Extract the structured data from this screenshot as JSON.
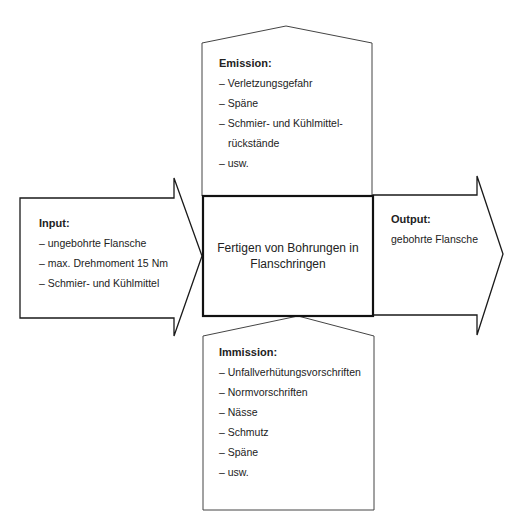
{
  "diagram": {
    "center": {
      "label": "Fertigen von Bohrungen in Flanschringen"
    },
    "emission": {
      "title": "Emission:",
      "items": [
        "– Verletzungsgefahr",
        "– Späne",
        "– Schmier- und Kühlmittel-",
        "  rückstände",
        "– usw."
      ]
    },
    "input": {
      "title": "Input:",
      "items": [
        "– ungebohrte Flansche",
        "– max. Drehmoment 15 Nm",
        "– Schmier- und Kühlmittel"
      ]
    },
    "output": {
      "title": "Output:",
      "items": [
        "gebohrte Flansche"
      ]
    },
    "immission": {
      "title": "Immission:",
      "items": [
        "– Unfallverhütungsvorschriften",
        "– Normvorschriften",
        "– Nässe",
        "– Schmutz",
        "– Späne",
        "– usw."
      ]
    },
    "colors": {
      "stroke": "#1a1a1a",
      "text": "#222222",
      "background": "#ffffff"
    }
  }
}
